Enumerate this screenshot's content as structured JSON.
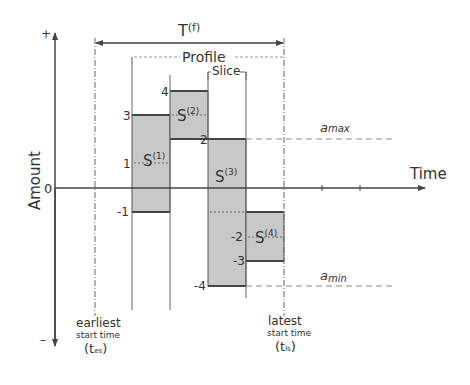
{
  "diagram": {
    "title": "T(f)",
    "title_base": "T",
    "title_sup": "(f)",
    "profile_label": "Profile",
    "slice_label": "Slice",
    "x_axis_label": "Time",
    "y_axis_label": "Amount",
    "y_plus": "+",
    "y_minus": "–",
    "zero_label": "0",
    "a_max_label": "a",
    "a_max_sub": "max",
    "a_min_label": "a",
    "a_min_sub": "min",
    "earliest": {
      "line1": "earliest",
      "line2": "start time",
      "symbol": "(t",
      "sub": "es",
      "close": ")"
    },
    "latest": {
      "line1": "latest",
      "line2": "start time",
      "symbol": "(t",
      "sub": "ls",
      "close": ")"
    },
    "slices": [
      {
        "name": "S",
        "sup": "(1)",
        "top": 3,
        "bottom": -1,
        "mid": 1,
        "labels": [
          "3",
          "1",
          "-1"
        ]
      },
      {
        "name": "S",
        "sup": "(2)",
        "top": 4,
        "bottom": 2,
        "mid": 3,
        "labels": [
          "4"
        ]
      },
      {
        "name": "S",
        "sup": "(3)",
        "top": 2,
        "bottom": -4,
        "mid": -1,
        "labels": [
          "2",
          "-4"
        ]
      },
      {
        "name": "S",
        "sup": "(4)",
        "top": -1,
        "bottom": -3,
        "mid": -2,
        "labels": [
          "-2",
          "-3"
        ]
      }
    ],
    "colors": {
      "fill": "#c8c8c8",
      "line": "#444444",
      "dash": "#888888"
    }
  }
}
